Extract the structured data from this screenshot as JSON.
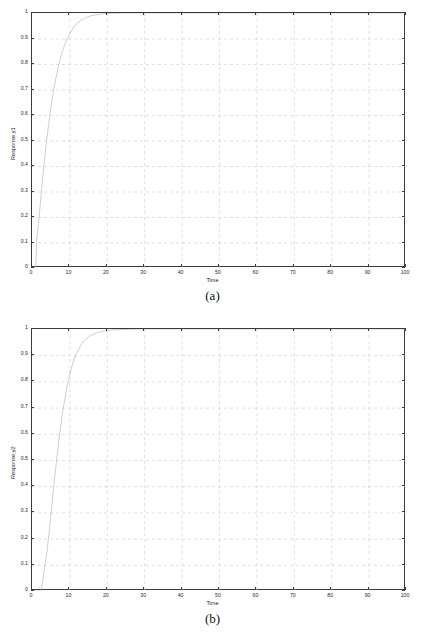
{
  "figure": {
    "panels": [
      {
        "id": "panel-a",
        "subfig_label": "(a)",
        "chart_data": {
          "type": "line",
          "title": "",
          "subtitle": "",
          "xlabel": "Time",
          "ylabel": "Response,y1",
          "xlim": [
            0,
            100
          ],
          "ylim": [
            0,
            1
          ],
          "grid": true,
          "legend": false,
          "legend_position": "none",
          "xticks": [
            0,
            10,
            20,
            30,
            40,
            50,
            60,
            70,
            80,
            90,
            100
          ],
          "xticklabels": [
            "0",
            "10",
            "20",
            "30",
            "40",
            "50",
            "60",
            "70",
            "80",
            "90",
            "100"
          ],
          "yticks": [
            0,
            0.1,
            0.2,
            0.3,
            0.4,
            0.5,
            0.6,
            0.7,
            0.8,
            0.9,
            1
          ],
          "yticklabels": [
            "0",
            "0.1",
            "0.2",
            "0.3",
            "0.4",
            "0.5",
            "0.6",
            "0.7",
            "0.8",
            "0.9",
            "1"
          ],
          "line_color": "#b9b9b9",
          "line_width": 0.7,
          "series": [
            {
              "name": "y1",
              "x": [
                0,
                1.0,
                1.2,
                1.5,
                2.0,
                2.5,
                3.0,
                3.5,
                4.0,
                4.5,
                5.0,
                5.5,
                6.0,
                6.5,
                7.0,
                7.5,
                8.0,
                8.5,
                9.0,
                9.5,
                10.0,
                11.0,
                12.0,
                13.0,
                14.0,
                15.0,
                16.0,
                17.0,
                18.0,
                20.0,
                22.0,
                25.0,
                30.0,
                40.0,
                50.0,
                60.0,
                70.0,
                80.0,
                90.0,
                100.0
              ],
              "y": [
                0.0,
                0.0,
                0.105,
                0.145,
                0.215,
                0.295,
                0.375,
                0.445,
                0.51,
                0.57,
                0.625,
                0.672,
                0.715,
                0.752,
                0.787,
                0.817,
                0.843,
                0.866,
                0.886,
                0.903,
                0.918,
                0.941,
                0.958,
                0.97,
                0.979,
                0.985,
                0.99,
                0.993,
                0.995,
                0.998,
                0.999,
                1.0,
                1.0,
                1.0,
                1.0,
                1.0,
                1.0,
                1.0,
                1.0,
                1.0
              ]
            }
          ]
        }
      },
      {
        "id": "panel-b",
        "subfig_label": "(b)",
        "chart_data": {
          "type": "line",
          "title": "",
          "subtitle": "",
          "xlabel": "Time",
          "ylabel": "Response,y2",
          "xlim": [
            0,
            100
          ],
          "ylim": [
            0,
            1
          ],
          "grid": true,
          "legend": false,
          "legend_position": "none",
          "xticks": [
            0,
            10,
            20,
            30,
            40,
            50,
            60,
            70,
            80,
            90,
            100
          ],
          "xticklabels": [
            "0",
            "10",
            "20",
            "30",
            "40",
            "50",
            "60",
            "70",
            "80",
            "90",
            "100"
          ],
          "yticks": [
            0,
            0.1,
            0.2,
            0.3,
            0.4,
            0.5,
            0.6,
            0.7,
            0.8,
            0.9,
            1
          ],
          "yticklabels": [
            "0",
            "0.1",
            "0.2",
            "0.3",
            "0.4",
            "0.5",
            "0.6",
            "0.7",
            "0.8",
            "0.9",
            "1"
          ],
          "line_color": "#b9b9b9",
          "line_width": 0.7,
          "series": [
            {
              "name": "y2",
              "x": [
                0,
                2.4,
                2.8,
                3.2,
                4.0,
                4.5,
                5.0,
                5.5,
                6.0,
                6.5,
                7.0,
                7.5,
                8.0,
                8.5,
                9.0,
                9.5,
                10.0,
                10.5,
                11.0,
                11.5,
                12.0,
                13.0,
                14.0,
                15.0,
                16.0,
                17.0,
                18.0,
                19.0,
                20.0,
                22.0,
                24.0,
                26.0,
                30.0,
                35.0,
                40.0,
                50.0,
                60.0,
                70.0,
                80.0,
                90.0,
                100.0
              ],
              "y": [
                0.0,
                0.0,
                0.035,
                0.075,
                0.15,
                0.215,
                0.285,
                0.355,
                0.425,
                0.49,
                0.552,
                0.61,
                0.663,
                0.71,
                0.752,
                0.789,
                0.821,
                0.849,
                0.873,
                0.893,
                0.91,
                0.937,
                0.956,
                0.969,
                0.978,
                0.984,
                0.989,
                0.992,
                0.994,
                0.997,
                0.998,
                0.999,
                1.0,
                1.0,
                1.0,
                1.0,
                1.0,
                1.0,
                1.0,
                1.0,
                1.0
              ]
            }
          ]
        }
      }
    ]
  }
}
